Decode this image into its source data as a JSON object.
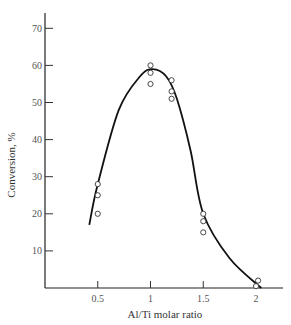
{
  "chart_data": {
    "type": "scatter",
    "title": "",
    "xlabel": "Al/Ti molar ratio",
    "ylabel": "Conversion, %",
    "xlim": [
      0,
      2.2
    ],
    "ylim": [
      0,
      73
    ],
    "x_ticks": [
      0.5,
      1,
      1.5,
      2
    ],
    "x_tick_labels": [
      "0.5",
      "1",
      "1.5",
      "2"
    ],
    "y_ticks": [
      10,
      20,
      30,
      40,
      50,
      60,
      70
    ],
    "y_tick_labels": [
      "10",
      "20",
      "30",
      "40",
      "50",
      "60",
      "70"
    ],
    "grid": false,
    "legend": null,
    "series": [
      {
        "name": "measured",
        "marker": "open-circle",
        "points": [
          {
            "x": 0.5,
            "y": 28
          },
          {
            "x": 0.5,
            "y": 25
          },
          {
            "x": 0.5,
            "y": 20
          },
          {
            "x": 1.0,
            "y": 60
          },
          {
            "x": 1.0,
            "y": 58
          },
          {
            "x": 1.0,
            "y": 55
          },
          {
            "x": 1.2,
            "y": 56
          },
          {
            "x": 1.2,
            "y": 53
          },
          {
            "x": 1.2,
            "y": 51
          },
          {
            "x": 1.5,
            "y": 20
          },
          {
            "x": 1.5,
            "y": 18
          },
          {
            "x": 1.5,
            "y": 15
          },
          {
            "x": 2.0,
            "y": 0.5
          },
          {
            "x": 2.02,
            "y": 2
          }
        ]
      },
      {
        "name": "fitted curve",
        "style": "smooth-line",
        "points": [
          {
            "x": 0.42,
            "y": 17
          },
          {
            "x": 0.5,
            "y": 28
          },
          {
            "x": 0.7,
            "y": 48
          },
          {
            "x": 0.9,
            "y": 57
          },
          {
            "x": 1.02,
            "y": 59
          },
          {
            "x": 1.15,
            "y": 57
          },
          {
            "x": 1.25,
            "y": 51
          },
          {
            "x": 1.38,
            "y": 37
          },
          {
            "x": 1.5,
            "y": 20
          },
          {
            "x": 1.75,
            "y": 8
          },
          {
            "x": 2.05,
            "y": 0
          }
        ]
      }
    ]
  }
}
